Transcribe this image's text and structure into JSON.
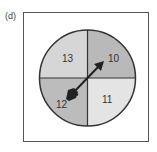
{
  "figure": {
    "label": "(d)",
    "spinner": {
      "sectors": [
        {
          "position": "top-left",
          "value": "13",
          "color": "#d6d6d6"
        },
        {
          "position": "top-right",
          "value": "10",
          "color": "#b9b9b9"
        },
        {
          "position": "bottom-right",
          "value": "11",
          "color": "#e4e4e4"
        },
        {
          "position": "bottom-left",
          "value": "12",
          "color": "#bcbcbc"
        }
      ],
      "pointer_direction": "toward-10",
      "outline_color": "#333333"
    }
  }
}
